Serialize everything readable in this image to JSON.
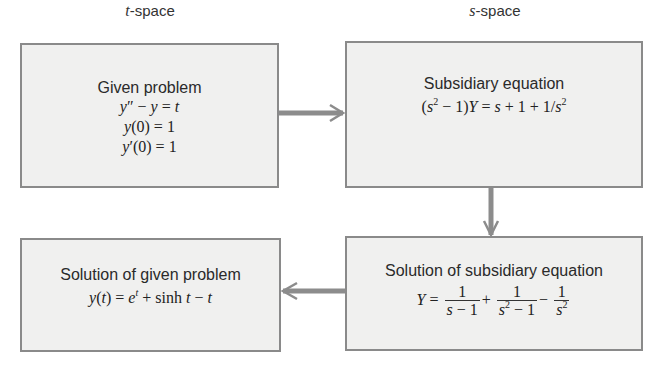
{
  "diagram": {
    "column_labels": {
      "left": "-space",
      "left_var": "t",
      "right": "-space",
      "right_var": "s"
    },
    "boxes": {
      "given_problem": {
        "title": "Given problem",
        "lines": [
          "y″ − y = t",
          "y(0) = 1",
          "y′(0) = 1"
        ]
      },
      "subsidiary_equation": {
        "title": "Subsidiary equation",
        "equation": "(s² − 1)Y = s + 1 + 1/s²"
      },
      "solution_subsidiary": {
        "title": "Solution of subsidiary equation",
        "equation": "Y = 1/(s − 1) + 1/(s² − 1) − 1/s²"
      },
      "solution_given": {
        "title": "Solution of given problem",
        "equation": "y(t) = eᵗ + sinh t − t"
      }
    },
    "arrows": [
      {
        "from": "given_problem",
        "to": "subsidiary_equation",
        "direction": "right"
      },
      {
        "from": "subsidiary_equation",
        "to": "solution_subsidiary",
        "direction": "down"
      },
      {
        "from": "solution_subsidiary",
        "to": "solution_given",
        "direction": "left"
      }
    ],
    "colors": {
      "box_fill": "#f0f0ef",
      "box_border": "#8a8a8a",
      "arrow": "#8c8c8c"
    }
  }
}
